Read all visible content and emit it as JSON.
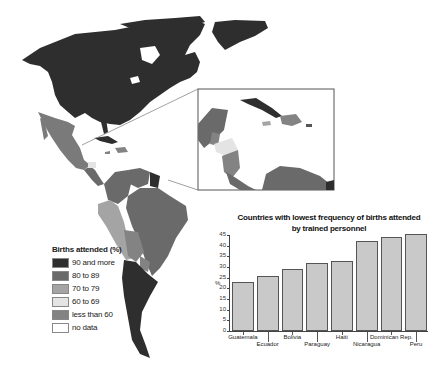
{
  "legend": {
    "title": "Births attended (%)",
    "items": [
      {
        "label": "90 and more",
        "color": "#2e2e2e"
      },
      {
        "label": "80 to 89",
        "color": "#6a6a6a"
      },
      {
        "label": "70 to 79",
        "color": "#a4a4a4"
      },
      {
        "label": "60 to 69",
        "color": "#e4e4e4"
      },
      {
        "label": "less than 60",
        "color": "#838383"
      },
      {
        "label": "no data",
        "color": "#ffffff"
      }
    ]
  },
  "inset": {
    "description": "Central America and Caribbean inset"
  },
  "chart_data": {
    "type": "bar",
    "title": "Countries with lowest frequency of births attended by trained personnel",
    "title_lines": [
      "Countries with lowest frequency of births attended",
      "by trained personnel"
    ],
    "xlabel": "",
    "ylabel": "%",
    "categories": [
      "Guatemala",
      "Ecuador",
      "Bolivia",
      "Paraguay",
      "Haiti",
      "Nicaragua",
      "Dominican Rep.",
      "Peru"
    ],
    "values": [
      23,
      26,
      29,
      32,
      33,
      42,
      44,
      45.5
    ],
    "ylim": [
      0,
      45
    ],
    "yticks": [
      0,
      5,
      10,
      15,
      20,
      25,
      30,
      35,
      40,
      45
    ],
    "grid": false,
    "legend_position": "none",
    "bar_color": "#c9c9c9"
  }
}
